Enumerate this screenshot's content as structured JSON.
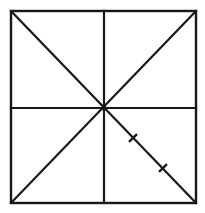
{
  "figure": {
    "background_color": "#ffffff",
    "stroke_color": "#17181a",
    "canvas": {
      "width": 205,
      "height": 213
    },
    "square": {
      "name": "outer-square",
      "left": 11,
      "top": 11,
      "right": 196,
      "bottom": 203,
      "stroke_width": 2.4
    },
    "center_point": {
      "x": 104,
      "y": 108
    },
    "medians": [
      {
        "name": "horizontal-median",
        "x1": 11,
        "y1": 108,
        "x2": 196,
        "y2": 108
      },
      {
        "name": "vertical-median",
        "x1": 104,
        "y1": 11,
        "x2": 104,
        "y2": 203
      }
    ],
    "diagonals": [
      {
        "name": "diagonal-top-left-to-bottom-right",
        "x1": 11,
        "y1": 11,
        "x2": 196,
        "y2": 203
      },
      {
        "name": "diagonal-bottom-left-to-top-right",
        "x1": 11,
        "y1": 203,
        "x2": 196,
        "y2": 11
      }
    ],
    "tick_marks": [
      {
        "name": "tick-mark-1",
        "x": 133,
        "y": 138,
        "length": 11,
        "on_segment": "center-to-bottom-right-corner"
      },
      {
        "name": "tick-mark-2",
        "x": 163,
        "y": 168,
        "length": 11,
        "on_segment": "center-to-bottom-right-corner"
      }
    ],
    "tick_count": 2,
    "labels": []
  }
}
